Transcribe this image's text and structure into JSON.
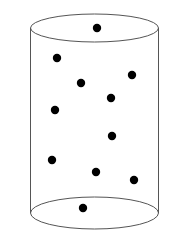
{
  "diagram": {
    "title": "",
    "shape": "cylinder",
    "stroke_color": "#555555",
    "dot_color": "#000000",
    "cylinder": {
      "top_ellipse": {
        "cx": 94.5,
        "cy": 28,
        "rx": 64,
        "ry": 14
      },
      "bottom_ellipse": {
        "cx": 94.5,
        "cy": 213,
        "rx": 64,
        "ry": 16
      },
      "left_x": 30.5,
      "right_x": 158.5
    },
    "dots": [
      {
        "x": 97,
        "y": 28
      },
      {
        "x": 57,
        "y": 58
      },
      {
        "x": 132,
        "y": 75
      },
      {
        "x": 81,
        "y": 83
      },
      {
        "x": 111,
        "y": 98
      },
      {
        "x": 55,
        "y": 110
      },
      {
        "x": 112,
        "y": 136
      },
      {
        "x": 52,
        "y": 160
      },
      {
        "x": 96,
        "y": 172
      },
      {
        "x": 134,
        "y": 180
      },
      {
        "x": 83,
        "y": 208
      }
    ],
    "dot_radius": 4.2,
    "dot_count": 11
  }
}
